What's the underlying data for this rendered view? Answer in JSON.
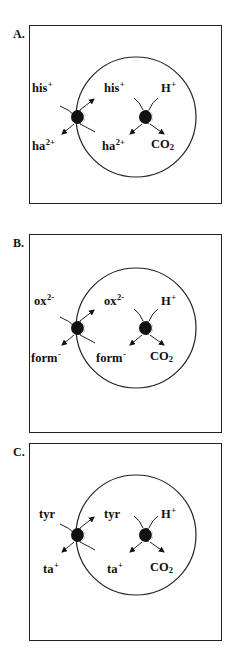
{
  "figure": {
    "panels": [
      {
        "id": "A",
        "letter": "A.",
        "outer": {
          "top_label": "his",
          "top_charge": "+",
          "bottom_label": "ha",
          "bottom_charge": "2+"
        },
        "inner": {
          "top_label": "his",
          "top_charge": "+",
          "bottom_label": "ha",
          "bottom_charge": "2+"
        },
        "decarboxylase": {
          "top_label": "H",
          "top_charge": "+",
          "bottom_label": "CO",
          "bottom_sub": "2"
        }
      },
      {
        "id": "B",
        "letter": "B.",
        "outer": {
          "top_label": "ox",
          "top_charge": "2-",
          "bottom_label": "form",
          "bottom_charge": "-"
        },
        "inner": {
          "top_label": "ox",
          "top_charge": "2-",
          "bottom_label": "form",
          "bottom_charge": "-"
        },
        "decarboxylase": {
          "top_label": "H",
          "top_charge": "+",
          "bottom_label": "CO",
          "bottom_sub": "2"
        }
      },
      {
        "id": "C",
        "letter": "C.",
        "outer": {
          "top_label": "tyr",
          "top_charge": "",
          "bottom_label": "ta",
          "bottom_charge": "+"
        },
        "inner": {
          "top_label": "tyr",
          "top_charge": "",
          "bottom_label": "ta",
          "bottom_charge": "+"
        },
        "decarboxylase": {
          "top_label": "H",
          "top_charge": "+",
          "bottom_label": "CO",
          "bottom_sub": "2"
        }
      }
    ],
    "colors": {
      "line": "#222222",
      "background": "#ffffff"
    }
  }
}
